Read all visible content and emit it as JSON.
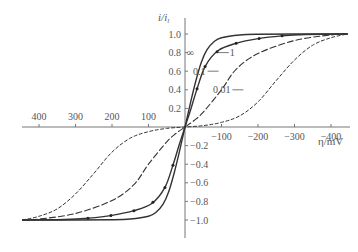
{
  "chart_data": {
    "type": "line",
    "title": "",
    "xlabel": "η/mV",
    "ylabel": "i/i_l",
    "ylabel_main": "i",
    "ylabel_sub": "l",
    "x_reversed": true,
    "xlim": [
      445,
      -450
    ],
    "ylim": [
      -1.15,
      1.15
    ],
    "grid": false,
    "x_ticks": [
      {
        "value": 400,
        "label": "400"
      },
      {
        "value": 300,
        "label": "300"
      },
      {
        "value": 200,
        "label": "200"
      },
      {
        "value": 100,
        "label": "100"
      },
      {
        "value": -100,
        "label": "−100"
      },
      {
        "value": -200,
        "label": "−200"
      },
      {
        "value": -300,
        "label": "−300"
      },
      {
        "value": -400,
        "label": "−400"
      }
    ],
    "y_ticks": [
      {
        "value": 1.0,
        "label": "1.0"
      },
      {
        "value": 0.8,
        "label": "0.8"
      },
      {
        "value": 0.6,
        "label": "0.6"
      },
      {
        "value": 0.4,
        "label": "0.4"
      },
      {
        "value": 0.2,
        "label": "0.2"
      },
      {
        "value": -0.2,
        "label": "−0.2"
      },
      {
        "value": -0.4,
        "label": "−0.4"
      },
      {
        "value": -0.6,
        "label": "−0.6"
      },
      {
        "value": -0.8,
        "label": "−0.8"
      },
      {
        "value": -1.0,
        "label": "−1.0"
      }
    ],
    "series": [
      {
        "name": "∞",
        "style": "solid",
        "markers": false,
        "x": [
          -445,
          -300,
          -200,
          -150,
          -100,
          -80,
          -60,
          -45,
          -30,
          -15,
          0
        ],
        "y": [
          1.0,
          1.0,
          0.998,
          0.99,
          0.96,
          0.92,
          0.83,
          0.7,
          0.5,
          0.26,
          0.0
        ],
        "symmetric": true,
        "label": {
          "text": "∞",
          "at_x": -30,
          "at_y": 0.8
        }
      },
      {
        "name": "1",
        "style": "solid",
        "markers": true,
        "x": [
          -445,
          -330,
          -265,
          -200,
          -140,
          -90,
          -55,
          -33,
          -15,
          0
        ],
        "y": [
          1.0,
          0.995,
          0.98,
          0.95,
          0.9,
          0.82,
          0.65,
          0.41,
          0.18,
          0.0
        ],
        "marker_x": [
          -33,
          -55,
          -88,
          -140,
          -203,
          -266
        ],
        "symmetric": true,
        "label": {
          "text": "1",
          "at_x": -120,
          "at_y": 0.8
        }
      },
      {
        "name": "0.1",
        "style": "dashed",
        "markers": false,
        "x": [
          -445,
          -400,
          -300,
          -200,
          -140,
          -100,
          -50,
          -25,
          0
        ],
        "y": [
          1.0,
          0.99,
          0.93,
          0.79,
          0.62,
          0.4,
          0.16,
          0.07,
          0.0
        ],
        "symmetric": true,
        "label": {
          "text": "0.1",
          "at_x": -92,
          "at_y": 0.6
        }
      },
      {
        "name": "0.01",
        "style": "short-dashed",
        "markers": false,
        "x": [
          -445,
          -400,
          -350,
          -300,
          -250,
          -200,
          -150,
          -100,
          -50,
          0
        ],
        "y": [
          1.0,
          0.96,
          0.88,
          0.72,
          0.5,
          0.27,
          0.12,
          0.05,
          0.015,
          0.0
        ],
        "symmetric": true,
        "label": {
          "text": "0.01",
          "at_x": -160,
          "at_y": 0.4
        }
      }
    ]
  }
}
